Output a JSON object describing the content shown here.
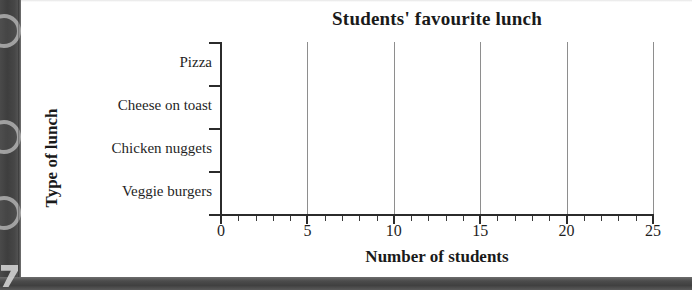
{
  "page": {
    "background_color": "#ffffff",
    "scan_edge_color": "#444444",
    "axis_color": "#2b2b2b",
    "gridline_color": "#8e8e8e"
  },
  "chart_data": {
    "type": "bar",
    "orientation": "horizontal",
    "title": "Students' favourite lunch",
    "xlabel": "Number of students",
    "ylabel": "Type of lunch",
    "categories": [
      "Pizza",
      "Cheese on toast",
      "Chicken nuggets",
      "Veggie burgers"
    ],
    "values": [
      null,
      null,
      null,
      null
    ],
    "series": [
      {
        "name": "Number of students",
        "values": [
          null,
          null,
          null,
          null
        ]
      }
    ],
    "xlim": [
      0,
      25
    ],
    "xticks": [
      0,
      5,
      10,
      15,
      20,
      25
    ],
    "xtick_labels": [
      "0",
      "5",
      "10",
      "15",
      "20",
      "25"
    ],
    "minor_tick_interval": 1,
    "grid": "vertical-major-only",
    "legend": null,
    "note": "Blank worksheet grid - no bars drawn"
  },
  "icons": {
    "binder_hole": "binder-hole-icon",
    "scan_edge": "scan-edge-icon"
  }
}
